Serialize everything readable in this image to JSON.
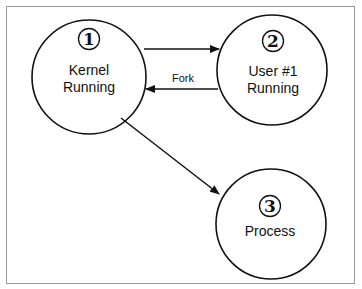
{
  "diagram": {
    "nodes": [
      {
        "id": 1,
        "number": "1",
        "lines": [
          "Kernel",
          "Running"
        ],
        "cx": 89,
        "cy": 77,
        "r": 57
      },
      {
        "id": 2,
        "number": "2",
        "lines": [
          "User #1",
          "Running"
        ],
        "cx": 272,
        "cy": 70,
        "r": 55
      },
      {
        "id": 3,
        "number": "3",
        "lines": [
          "Process"
        ],
        "cx": 271,
        "cy": 224,
        "r": 55
      }
    ],
    "edges": [
      {
        "from": 1,
        "to": 2,
        "label": ""
      },
      {
        "from": 2,
        "to": 1,
        "label": "Fork"
      },
      {
        "from": 1,
        "to": 3,
        "label": ""
      }
    ],
    "colors": {
      "stroke": "#111111",
      "frame": "#9a9a9a",
      "background": "#ffffff"
    }
  }
}
